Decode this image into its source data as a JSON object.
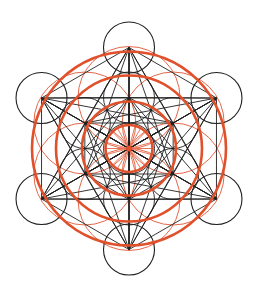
{
  "geometry": {
    "center": [
      129,
      148.5
    ],
    "small_circle_radius": 25.5,
    "inner_ring_radius": 51,
    "outer_ring_radius": 101,
    "point_count": 13
  },
  "colors": {
    "background": "#ffffff",
    "line": "#1f1f1f",
    "accent": "#e0502a",
    "accent_thin": "#e4684a"
  },
  "orange_rings": {
    "thick_radii": [
      23.5,
      47,
      73,
      97
    ],
    "thin_radius_around_inner_points": 51,
    "spokes": 24,
    "center_dot_radius": 3
  }
}
